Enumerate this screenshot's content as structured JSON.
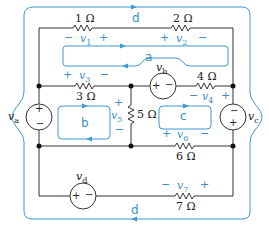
{
  "colors": {
    "wire": "#333333",
    "loop": "#3a9ad5",
    "node": "#111111"
  },
  "resistors": [
    {
      "id": "R1",
      "label": "1 Ω"
    },
    {
      "id": "R2",
      "label": "2 Ω"
    },
    {
      "id": "R3",
      "label": "3 Ω"
    },
    {
      "id": "R4",
      "label": "4 Ω"
    },
    {
      "id": "R5",
      "label": "5 Ω"
    },
    {
      "id": "R6",
      "label": "6 Ω"
    },
    {
      "id": "R7",
      "label": "7 Ω"
    }
  ],
  "sources": {
    "va": {
      "label": "v",
      "sub": "a",
      "plus": "+",
      "minus": "−"
    },
    "vb": {
      "label": "v",
      "sub": "b",
      "plus": "+",
      "minus": "−"
    },
    "vc": {
      "label": "v",
      "sub": "c",
      "plus": "+",
      "minus": "−"
    },
    "vd": {
      "label": "v",
      "sub": "d",
      "plus": "+",
      "minus": "−"
    }
  },
  "voltages": {
    "v1": {
      "label": "v",
      "sub": "1",
      "left": "−",
      "right": "+"
    },
    "v2": {
      "label": "v",
      "sub": "2",
      "left": "+",
      "right": "−"
    },
    "v3": {
      "label": "v",
      "sub": "3",
      "left": "+",
      "right": "−"
    },
    "v4": {
      "label": "v",
      "sub": "4",
      "left": "−",
      "right": "+"
    },
    "v5": {
      "label": "v",
      "sub": "5",
      "top": "+",
      "bottom": "−"
    },
    "v6": {
      "label": "v",
      "sub": "6",
      "left": "+",
      "right": "−"
    },
    "v7": {
      "label": "v",
      "sub": "7",
      "left": "−",
      "right": "+"
    }
  },
  "loops": {
    "a": "a",
    "b": "b",
    "c": "c",
    "d_top": "d",
    "d_bottom": "d"
  }
}
